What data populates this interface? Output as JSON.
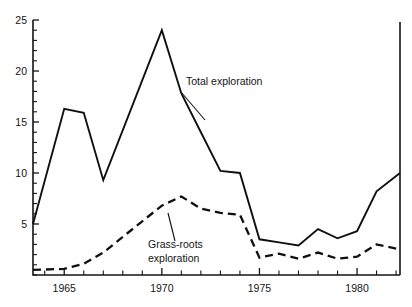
{
  "chart_data": {
    "type": "line",
    "title": "",
    "subtitle": "",
    "xlabel": "",
    "ylabel": "",
    "xlim": [
      1963.4,
      1982.2
    ],
    "ylim": [
      0,
      25
    ],
    "grid": false,
    "legend_position": "inline-annotations",
    "y_ticks": [
      5,
      10,
      15,
      20,
      25
    ],
    "y_tick_labels": [
      "5",
      "10",
      "15",
      "20",
      "25"
    ],
    "y_minor_tick_step": 1,
    "x_ticks": [
      1965,
      1970,
      1975,
      1980
    ],
    "x_tick_labels": [
      "1965",
      "1970",
      "1975",
      "1980"
    ],
    "x_minor_tick_step": 1,
    "x": [
      1963.4,
      1965,
      1966,
      1967,
      1970,
      1971,
      1972,
      1973,
      1974,
      1975,
      1976,
      1977,
      1978,
      1979,
      1980,
      1981,
      1982.2
    ],
    "series": [
      {
        "name": "Total exploration",
        "style": "solid",
        "values": [
          5.0,
          16.3,
          15.9,
          9.3,
          24.0,
          17.8,
          14.0,
          10.2,
          10.0,
          3.5,
          3.2,
          2.9,
          4.5,
          3.6,
          4.3,
          8.2,
          10.0
        ]
      },
      {
        "name": "Grass-roots exploration",
        "style": "dashed",
        "values": [
          0.5,
          0.6,
          1.1,
          2.2,
          6.8,
          7.7,
          6.5,
          6.1,
          5.9,
          1.7,
          2.1,
          1.6,
          2.2,
          1.6,
          1.8,
          3.0,
          2.5
        ]
      }
    ],
    "annotations": [
      {
        "text": "Total exploration",
        "x_px": 186,
        "y_px": 85,
        "leader_from_x_px": 181,
        "leader_from_y_px": 92,
        "leader_to_x_px": 205,
        "leader_to_y_px": 120
      },
      {
        "text": "Grass-roots",
        "x_px": 148,
        "y_px": 248,
        "leader_from_x_px": 175,
        "leader_from_y_px": 241,
        "leader_to_x_px": 168,
        "leader_to_y_px": 213
      },
      {
        "text": "exploration",
        "x_px": 148,
        "y_px": 262,
        "leader_from_x_px": null,
        "leader_from_y_px": null,
        "leader_to_x_px": null,
        "leader_to_y_px": null
      }
    ],
    "colors": {
      "axis": "#141414",
      "series_total": "#101010",
      "series_grassroots": "#101010",
      "background": "#ffffff"
    }
  }
}
